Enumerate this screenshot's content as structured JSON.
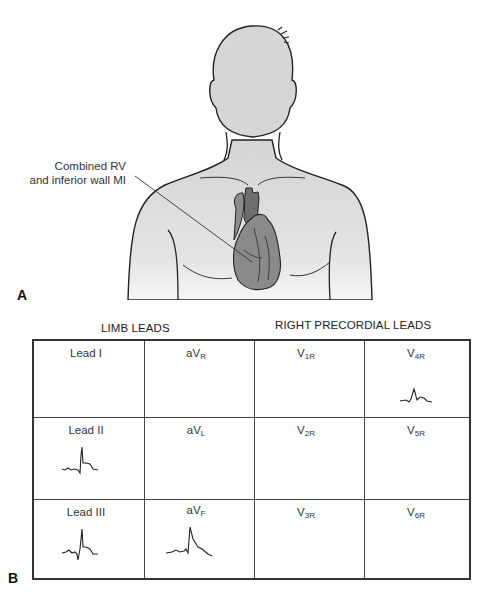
{
  "figure": {
    "panel_a": {
      "label": "A",
      "callout_line1": "Combined RV",
      "callout_line2": "and inferior wall MI"
    },
    "panel_b": {
      "label": "B",
      "header_limb": "LIMB LEADS",
      "header_precordial": "RIGHT PRECORDIAL LEADS",
      "cells": [
        {
          "row": 0,
          "col": 0,
          "lead": "Lead I",
          "base": "Lead I",
          "sub": "",
          "trace": "none"
        },
        {
          "row": 0,
          "col": 1,
          "lead": "aVR",
          "base": "aV",
          "sub": "R",
          "trace": "none"
        },
        {
          "row": 0,
          "col": 2,
          "lead": "V1R",
          "base": "V",
          "sub": "1R",
          "trace": "none"
        },
        {
          "row": 0,
          "col": 3,
          "lead": "V4R",
          "base": "V",
          "sub": "4R",
          "trace": "st-elevation-small"
        },
        {
          "row": 1,
          "col": 0,
          "lead": "Lead II",
          "base": "Lead II",
          "sub": "",
          "trace": "st-elevation"
        },
        {
          "row": 1,
          "col": 1,
          "lead": "aVL",
          "base": "aV",
          "sub": "L",
          "trace": "none"
        },
        {
          "row": 1,
          "col": 2,
          "lead": "V2R",
          "base": "V",
          "sub": "2R",
          "trace": "none"
        },
        {
          "row": 1,
          "col": 3,
          "lead": "V5R",
          "base": "V",
          "sub": "5R",
          "trace": "none"
        },
        {
          "row": 2,
          "col": 0,
          "lead": "Lead III",
          "base": "Lead III",
          "sub": "",
          "trace": "st-elevation"
        },
        {
          "row": 2,
          "col": 1,
          "lead": "aVF",
          "base": "aV",
          "sub": "F",
          "trace": "st-elevation"
        },
        {
          "row": 2,
          "col": 2,
          "lead": "V3R",
          "base": "V",
          "sub": "3R",
          "trace": "none"
        },
        {
          "row": 2,
          "col": 3,
          "lead": "V6R",
          "base": "V",
          "sub": "6R",
          "trace": "none"
        }
      ]
    },
    "colors": {
      "body_fill": "#dedede",
      "heart_dark": "#6e6e6e",
      "heart_mid": "#8c8c8c",
      "outline": "#222222"
    }
  }
}
